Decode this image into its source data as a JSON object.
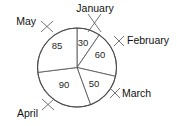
{
  "chart_data": {
    "type": "pie",
    "title": "",
    "subtitle": "",
    "xlabel": "",
    "ylabel": "",
    "legend_position": "none",
    "grid": false,
    "total": 315,
    "categories": [
      "January",
      "February",
      "March",
      "April",
      "May"
    ],
    "values": [
      30,
      60,
      50,
      90,
      85
    ],
    "slices": [
      {
        "label": "January",
        "value": 30,
        "value_text": "30",
        "percent": 9.5,
        "start_angle_deg": 0,
        "end_angle_deg": 34.3,
        "value_pos": {
          "x": 83,
          "y": 43
        },
        "label_pos": {
          "x": 95,
          "y": 9
        },
        "label_anchor": "mid",
        "leader": {
          "x1": 88,
          "y1": 14,
          "x2": 101,
          "y2": 32,
          "x3": 101,
          "y3": 14,
          "x4": 88,
          "y4": 32
        }
      },
      {
        "label": "February",
        "value": 60,
        "value_text": "60",
        "percent": 19.0,
        "start_angle_deg": 34.3,
        "end_angle_deg": 102.9,
        "value_pos": {
          "x": 100,
          "y": 55
        },
        "label_pos": {
          "x": 127,
          "y": 41
        },
        "label_anchor": "right",
        "leader": {
          "x1": 114,
          "y1": 36,
          "x2": 124,
          "y2": 46,
          "x3": 124,
          "y3": 36,
          "x4": 114,
          "y4": 46
        }
      },
      {
        "label": "March",
        "value": 50,
        "value_text": "50",
        "percent": 15.9,
        "start_angle_deg": 102.9,
        "end_angle_deg": 160.0,
        "value_pos": {
          "x": 94,
          "y": 84
        },
        "label_pos": {
          "x": 122,
          "y": 94
        },
        "label_anchor": "right",
        "leader": {
          "x1": 110,
          "y1": 88,
          "x2": 120,
          "y2": 98,
          "x3": 120,
          "y3": 88,
          "x4": 110,
          "y4": 98
        }
      },
      {
        "label": "April",
        "value": 90,
        "value_text": "90",
        "percent": 28.6,
        "start_angle_deg": 160.0,
        "end_angle_deg": 262.9,
        "value_pos": {
          "x": 64,
          "y": 85
        },
        "label_pos": {
          "x": 38,
          "y": 114
        },
        "label_anchor": "left",
        "leader": {
          "x1": 42,
          "y1": 99,
          "x2": 54,
          "y2": 110,
          "x3": 54,
          "y3": 99,
          "x4": 42,
          "y4": 110
        }
      },
      {
        "label": "May",
        "value": 85,
        "value_text": "85",
        "percent": 27.0,
        "start_angle_deg": 262.9,
        "end_angle_deg": 360.0,
        "value_pos": {
          "x": 57,
          "y": 46
        },
        "label_pos": {
          "x": 36,
          "y": 22
        },
        "label_anchor": "left",
        "leader": {
          "x1": 41,
          "y1": 21,
          "x2": 53,
          "y2": 32,
          "x3": 53,
          "y3": 21,
          "x4": 41,
          "y4": 32
        }
      }
    ],
    "geometry": {
      "center_x": 77,
      "center_y": 67.5,
      "radius": 39.5
    },
    "colors": {
      "slice_fill": "#ffffff",
      "slice_stroke": "#5a5a5a",
      "text": "#111111",
      "background": "#ffffff"
    }
  }
}
